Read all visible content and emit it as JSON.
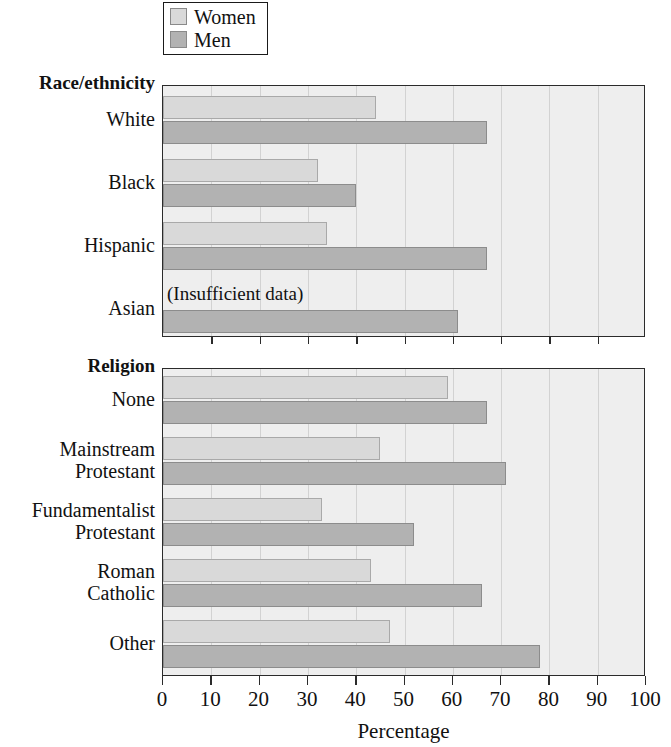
{
  "legend": {
    "items": [
      {
        "label": "Women",
        "color": "#d9d9d9"
      },
      {
        "label": "Men",
        "color": "#b2b2b2"
      }
    ]
  },
  "axis": {
    "xlabel": "Percentage",
    "ticks": [
      "0",
      "10",
      "20",
      "30",
      "40",
      "50",
      "60",
      "70",
      "80",
      "90",
      "100"
    ]
  },
  "panels": [
    {
      "title": "Race/ethnicity",
      "categories": [
        {
          "label": "White",
          "women": 44,
          "men": 67
        },
        {
          "label": "Black",
          "women": 32,
          "men": 40
        },
        {
          "label": "Hispanic",
          "women": 34,
          "men": 67
        },
        {
          "label": "Asian",
          "women": null,
          "men": 61,
          "note": "(Insufficient data)"
        }
      ]
    },
    {
      "title": "Religion",
      "categories": [
        {
          "label": "None",
          "women": 59,
          "men": 67
        },
        {
          "label": "Mainstream Protestant",
          "label_lines": [
            "Mainstream",
            "Protestant"
          ],
          "women": 45,
          "men": 71
        },
        {
          "label": "Fundamentalist Protestant",
          "label_lines": [
            "Fundamentalist",
            "Protestant"
          ],
          "women": 33,
          "men": 52
        },
        {
          "label": "Roman Catholic",
          "label_lines": [
            "Roman",
            "Catholic"
          ],
          "women": 43,
          "men": 66
        },
        {
          "label": "Other",
          "women": 47,
          "men": 78
        }
      ]
    }
  ],
  "chart_data": {
    "type": "bar",
    "orientation": "horizontal",
    "title": "",
    "xlabel": "Percentage",
    "ylabel": "",
    "xlim": [
      0,
      100
    ],
    "xticks": [
      0,
      10,
      20,
      30,
      40,
      50,
      60,
      70,
      80,
      90,
      100
    ],
    "grid": "vertical",
    "legend": [
      "Women",
      "Men"
    ],
    "legend_position": "top-left",
    "panels": [
      {
        "group": "Race/ethnicity",
        "categories": [
          "White",
          "Black",
          "Hispanic",
          "Asian"
        ],
        "series": [
          {
            "name": "Women",
            "values": [
              44,
              32,
              34,
              null
            ]
          },
          {
            "name": "Men",
            "values": [
              67,
              40,
              67,
              61
            ]
          }
        ],
        "annotations": [
          {
            "category": "Asian",
            "series": "Women",
            "text": "(Insufficient data)"
          }
        ]
      },
      {
        "group": "Religion",
        "categories": [
          "None",
          "Mainstream Protestant",
          "Fundamentalist Protestant",
          "Roman Catholic",
          "Other"
        ],
        "series": [
          {
            "name": "Women",
            "values": [
              59,
              45,
              33,
              43,
              47
            ]
          },
          {
            "name": "Men",
            "values": [
              67,
              71,
              52,
              66,
              78
            ]
          }
        ],
        "annotations": []
      }
    ]
  }
}
